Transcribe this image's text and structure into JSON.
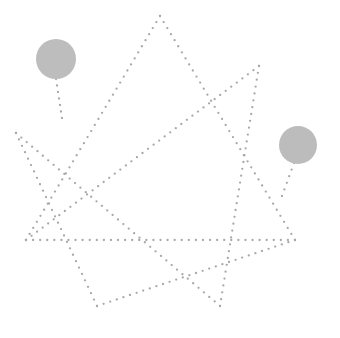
{
  "figure": {
    "background_color": "#ffffff",
    "width": 340,
    "height": 338
  },
  "style": {
    "dot_color": "#a8a8ac",
    "dot_radius": 1.15,
    "dot_spacing": 7,
    "dash_pattern": "0.1 7",
    "stroke_width": 2.3,
    "node_fill_color": "#bdbdbd",
    "node_fill_color_alt": "#bcbcbc"
  },
  "chart_data": {
    "type": "scatter",
    "xlabel": "",
    "ylabel": "",
    "xlim": [
      0,
      340
    ],
    "ylim": [
      0,
      338
    ],
    "grid": false,
    "legend": "none",
    "star_polygon": {
      "description": "7-pointed star polygon (heptagram) rendered as dotted line segments",
      "points": 7,
      "step": 2,
      "center": [
        157,
        162
      ],
      "radius": 147,
      "rotation_deg": -90,
      "vertices": [
        {
          "name": "apex-top",
          "x": 160,
          "y": 16
        },
        {
          "name": "vertex-upper-right",
          "x": 259,
          "y": 66
        },
        {
          "name": "vertex-right",
          "x": 295,
          "y": 240
        },
        {
          "name": "vertex-lower-right",
          "x": 220,
          "y": 306
        },
        {
          "name": "vertex-lower-left",
          "x": 97,
          "y": 306
        },
        {
          "name": "vertex-left",
          "x": 26,
          "y": 240
        },
        {
          "name": "vertex-upper-left",
          "x": 16,
          "y": 133
        }
      ],
      "edges": [
        {
          "from": "apex-top",
          "to": "vertex-right"
        },
        {
          "from": "vertex-right",
          "to": "vertex-lower-left"
        },
        {
          "from": "vertex-lower-left",
          "to": "vertex-upper-left"
        },
        {
          "from": "vertex-upper-left",
          "to": "vertex-lower-right"
        },
        {
          "from": "vertex-lower-right",
          "to": "vertex-upper-right"
        },
        {
          "from": "vertex-upper-right",
          "to": "vertex-left"
        },
        {
          "from": "vertex-left",
          "to": "apex-top"
        }
      ],
      "horizontal_chord": {
        "x1": 26,
        "y1": 240,
        "x2": 295,
        "y2": 240
      }
    },
    "nodes": [
      {
        "name": "node-left",
        "cx": 56,
        "cy": 59,
        "r": 20,
        "fill": "#bdbdbd"
      },
      {
        "name": "node-right",
        "cx": 298,
        "cy": 145,
        "r": 19,
        "fill": "#bcbcbc"
      }
    ],
    "node_stems": [
      {
        "name": "stem-left",
        "x1": 56,
        "y1": 79,
        "x2": 62,
        "y2": 118
      },
      {
        "name": "stem-right",
        "x1": 294,
        "y1": 163,
        "x2": 282,
        "y2": 196
      }
    ]
  }
}
